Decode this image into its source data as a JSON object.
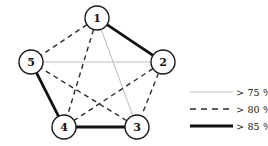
{
  "figure": {
    "type": "network-graph"
  },
  "chart_data": {
    "type": "diagram",
    "title": "",
    "subtitle": "",
    "xlabel": "",
    "ylabel": "",
    "graph_kind": "undirected-complete-graph",
    "node_count": 5,
    "edge_count": 10,
    "layout": "regular pentagon, node 1 at top, clockwise 1-2-3-4-5",
    "nodes": [
      {
        "id": "1",
        "label": "1",
        "cx": 97,
        "cy": 18,
        "r": 12
      },
      {
        "id": "2",
        "label": "2",
        "cx": 163,
        "cy": 62,
        "r": 12
      },
      {
        "id": "3",
        "label": "3",
        "cx": 137,
        "cy": 127,
        "r": 12
      },
      {
        "id": "4",
        "label": "4",
        "cx": 64,
        "cy": 127,
        "r": 12
      },
      {
        "id": "5",
        "label": "5",
        "cx": 31,
        "cy": 62,
        "r": 12
      }
    ],
    "edges": [
      {
        "source": "1",
        "target": "2",
        "style": "thick-solid",
        "category": "> 85 %"
      },
      {
        "source": "1",
        "target": "5",
        "style": "dashed",
        "category": "> 80 %"
      },
      {
        "source": "1",
        "target": "3",
        "style": "thin-gray",
        "category": "> 75 %"
      },
      {
        "source": "1",
        "target": "4",
        "style": "dashed",
        "category": "> 80 %"
      },
      {
        "source": "2",
        "target": "5",
        "style": "thin-gray",
        "category": "> 75 %"
      },
      {
        "source": "2",
        "target": "3",
        "style": "dashed",
        "category": "> 80 %"
      },
      {
        "source": "2",
        "target": "4",
        "style": "dashed",
        "category": "> 80 %"
      },
      {
        "source": "3",
        "target": "4",
        "style": "thick-solid",
        "category": "> 85 %"
      },
      {
        "source": "3",
        "target": "5",
        "style": "dashed",
        "category": "> 80 %"
      },
      {
        "source": "4",
        "target": "5",
        "style": "thick-solid",
        "category": "> 85 %"
      }
    ],
    "legend_position": "right",
    "grid": false
  },
  "legend": {
    "entries": [
      {
        "key": "gt75",
        "label": "> 75 %",
        "style": "thin-gray",
        "color": "#bdbdbd",
        "width": 1,
        "dash": "none"
      },
      {
        "key": "gt80",
        "label": "> 80 %",
        "style": "dashed",
        "color": "#2b2b2b",
        "width": 1.4,
        "dash": "6 5"
      },
      {
        "key": "gt85",
        "label": "> 85 %",
        "style": "thick-solid",
        "color": "#111111",
        "width": 2.8,
        "dash": "none"
      }
    ]
  },
  "colors": {
    "thin_gray": "#bdbdbd",
    "dashed": "#2b2b2b",
    "thick_solid": "#111111",
    "node_stroke": "#1a1a1a",
    "node_fill": "#ffffff",
    "text": "#111111",
    "background": "#ffffff"
  }
}
